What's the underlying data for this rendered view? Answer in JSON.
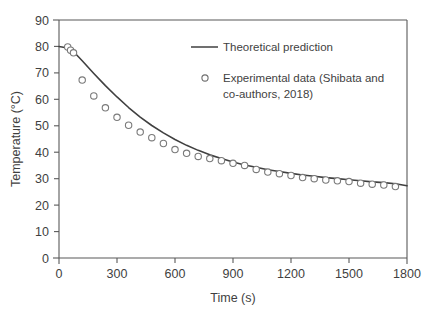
{
  "chart_data": {
    "type": "scatter",
    "title": "",
    "xlabel": "Time (s)",
    "ylabel": "Temperature (°C)",
    "xlim": [
      0,
      1800
    ],
    "ylim": [
      0,
      90
    ],
    "xticks": [
      0,
      300,
      600,
      900,
      1200,
      1500,
      1800
    ],
    "yticks": [
      0,
      10,
      20,
      30,
      40,
      50,
      60,
      70,
      80,
      90
    ],
    "xtick_labels": [
      "0",
      "300",
      "600",
      "900",
      "1200",
      "1500",
      "1800"
    ],
    "ytick_labels": [
      "0",
      "10",
      "20",
      "30",
      "40",
      "50",
      "60",
      "70",
      "80",
      "90"
    ],
    "grid": false,
    "legend_position": "upper-right-inside",
    "series": [
      {
        "name": "Theoretical prediction",
        "render": "line",
        "color": "#404040",
        "x": [
          0,
          60,
          120,
          180,
          240,
          300,
          360,
          420,
          480,
          540,
          600,
          660,
          720,
          780,
          840,
          900,
          960,
          1020,
          1080,
          1140,
          1200,
          1260,
          1320,
          1380,
          1440,
          1500,
          1560,
          1620,
          1680,
          1740,
          1800
        ],
        "y": [
          80.0,
          79.2,
          74.6,
          69.8,
          65.2,
          60.9,
          56.9,
          53.3,
          50.1,
          47.3,
          44.8,
          42.6,
          40.7,
          39.0,
          37.6,
          36.3,
          35.2,
          34.3,
          33.4,
          32.7,
          32.0,
          31.4,
          30.9,
          30.4,
          30.0,
          29.6,
          29.2,
          28.8,
          28.5,
          28.1,
          27.3
        ]
      },
      {
        "name": "Experimental data (Shibata and co-authors, 2018)",
        "render": "markers",
        "marker": "open-circle",
        "color": "#7a7a7a",
        "fill": "#ffffff",
        "x": [
          45,
          60,
          75,
          120,
          180,
          240,
          300,
          360,
          420,
          480,
          540,
          600,
          660,
          720,
          780,
          840,
          900,
          960,
          1020,
          1080,
          1140,
          1200,
          1260,
          1320,
          1380,
          1440,
          1500,
          1560,
          1620,
          1680,
          1740
        ],
        "y": [
          79.8,
          78.6,
          77.6,
          67.3,
          61.3,
          56.8,
          53.2,
          50.2,
          47.6,
          45.5,
          43.3,
          41.0,
          39.6,
          38.4,
          37.6,
          36.8,
          35.8,
          35.0,
          33.5,
          32.5,
          31.9,
          31.2,
          30.4,
          30.0,
          29.5,
          29.2,
          28.9,
          28.3,
          27.9,
          27.6,
          27.0
        ]
      }
    ]
  },
  "legend": {
    "entries": [
      {
        "label": "Theoretical prediction",
        "marker": "line"
      },
      {
        "label": "Experimental data (Shibata and",
        "label2": "co-authors, 2018)",
        "marker": "open-circle"
      }
    ]
  },
  "colors": {
    "line": "#404040",
    "marker_stroke": "#7a7a7a",
    "marker_fill": "#ffffff",
    "axis": "#595959",
    "text": "#3f3f3f",
    "background": "#ffffff"
  }
}
